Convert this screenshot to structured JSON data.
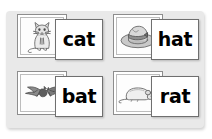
{
  "board": {
    "background_color": "#e9e9e9",
    "description": "word-family picture and word card set"
  },
  "pairs": [
    {
      "id": "cat",
      "word": "cat",
      "picture_icon": "cat-icon",
      "picture_alt": "sitting cat"
    },
    {
      "id": "hat",
      "word": "hat",
      "picture_icon": "hat-icon",
      "picture_alt": "fedora hat"
    },
    {
      "id": "bat",
      "word": "bat",
      "picture_icon": "bat-icon",
      "picture_alt": "flying bat"
    },
    {
      "id": "rat",
      "word": "rat",
      "picture_icon": "rat-icon",
      "picture_alt": "lying rat"
    }
  ],
  "colors": {
    "board": "#e9e9e9",
    "card": "#ffffff",
    "card_border": "#8d8d8d",
    "text": "#000000",
    "page": "#ffffff"
  }
}
